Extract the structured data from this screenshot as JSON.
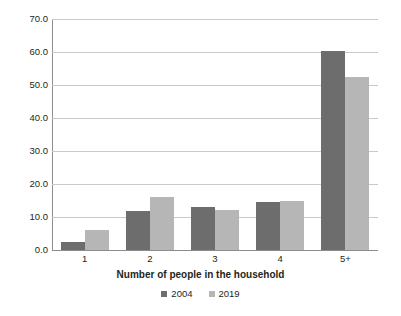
{
  "chart_data": {
    "type": "bar",
    "title": "",
    "subtitle": "",
    "xlabel": "Number of people in the household",
    "ylabel": "",
    "categories": [
      "1",
      "2",
      "3",
      "4",
      "5+"
    ],
    "series": [
      {
        "name": "2004",
        "color": "#6d6d6d",
        "values": [
          2.4,
          11.9,
          12.9,
          14.4,
          60.2
        ]
      },
      {
        "name": "2019",
        "color": "#b6b6b6",
        "values": [
          6.2,
          16.0,
          12.1,
          14.8,
          52.5
        ]
      }
    ],
    "ylim": [
      0,
      70
    ],
    "ytick_step": 10,
    "ytick_labels": [
      "70.0",
      "60.0",
      "50.0",
      "40.0",
      "30.0",
      "20.0",
      "10.0",
      "0.0"
    ],
    "ytick_values": [
      70,
      60,
      50,
      40,
      30,
      20,
      10,
      0
    ],
    "grid": true,
    "grid_axis": "y",
    "legend_position": "bottom-center",
    "axis_color": "#8d8d8d",
    "grid_color": "#c9c9c9",
    "background": "#ffffff"
  }
}
